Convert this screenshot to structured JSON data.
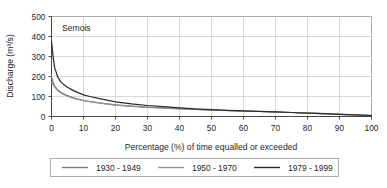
{
  "chart_data": {
    "type": "line",
    "title": "",
    "annotation": "Semois",
    "xlabel": "Percentage (%) of time equalled or exceeded",
    "ylabel": "Discharge  (m³/s)",
    "xlim": [
      0,
      100
    ],
    "ylim": [
      0,
      500
    ],
    "xticks": [
      0,
      10,
      20,
      30,
      40,
      50,
      60,
      70,
      80,
      90,
      100
    ],
    "yticks": [
      0,
      100,
      200,
      300,
      400,
      500
    ],
    "xtick_labels": [
      "0",
      "10",
      "20",
      "30",
      "40",
      "50",
      "60",
      "70",
      "80",
      "90",
      "100"
    ],
    "ytick_labels": [
      "0",
      "100",
      "200",
      "300",
      "400",
      "500"
    ],
    "grid": "horizontal-and-vertical",
    "legend_position": "below-outside",
    "x": [
      0,
      0.5,
      1,
      2,
      3,
      4,
      5,
      7,
      10,
      12,
      15,
      20,
      25,
      30,
      35,
      40,
      45,
      50,
      55,
      60,
      65,
      70,
      75,
      80,
      85,
      90,
      95,
      100
    ],
    "series": [
      {
        "name": "1930 - 1949",
        "color": "#7d7d7d",
        "values": [
          200,
          168,
          152,
          132,
          120,
          112,
          104,
          93,
          80,
          75,
          68,
          58,
          52,
          47,
          43,
          39,
          35,
          32,
          30,
          27,
          25,
          23,
          20,
          17,
          14,
          11,
          8,
          5
        ]
      },
      {
        "name": "1950 - 1970",
        "color": "#8f8f8f",
        "values": [
          170,
          160,
          148,
          128,
          117,
          109,
          102,
          91,
          79,
          74,
          67,
          57,
          51,
          46,
          42,
          38,
          35,
          32,
          29,
          27,
          25,
          22,
          20,
          17,
          14,
          11,
          8,
          5
        ]
      },
      {
        "name": "1979 - 1999",
        "color": "#2b2b2b",
        "values": [
          375,
          300,
          243,
          196,
          172,
          157,
          146,
          128,
          108,
          100,
          89,
          73,
          63,
          55,
          49,
          43,
          38,
          34,
          31,
          28,
          26,
          23,
          20,
          17,
          14,
          11,
          8,
          5
        ]
      }
    ],
    "legend": [
      {
        "label": "1930 - 1949",
        "color": "#7d7d7d"
      },
      {
        "label": "1950 - 1970",
        "color": "#8f8f8f"
      },
      {
        "label": "1979 - 1999",
        "color": "#2b2b2b"
      }
    ]
  }
}
